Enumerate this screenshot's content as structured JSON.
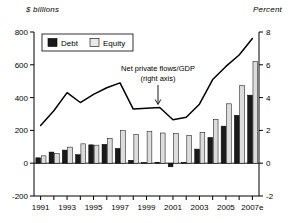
{
  "chart_data": {
    "type": "bar",
    "title": "",
    "subtitle": "",
    "left_axis_label": "$ billions",
    "right_axis_label": "Percent",
    "xlabel": "",
    "ylabel": "$ billions",
    "ylim": [
      -200,
      800
    ],
    "y2lim": [
      -2,
      8
    ],
    "left_ticks": [
      "800",
      "600",
      "400",
      "200",
      "0",
      "-200"
    ],
    "left_tick_values": [
      800,
      600,
      400,
      200,
      0,
      -200
    ],
    "right_ticks": [
      "8",
      "6",
      "4",
      "2",
      "0",
      "-2"
    ],
    "right_tick_values": [
      8,
      6,
      4,
      2,
      0,
      -2
    ],
    "grid": false,
    "legend_position": "top-left",
    "categories": [
      "1991",
      "1992",
      "1993",
      "1994",
      "1995",
      "1996",
      "1997",
      "1998",
      "1999",
      "2000",
      "2001",
      "2002",
      "2003",
      "2004",
      "2005",
      "2006",
      "2007e"
    ],
    "xtick_labels": [
      "1991",
      "",
      "1993",
      "",
      "1995",
      "",
      "1997",
      "",
      "1999",
      "",
      "2001",
      "",
      "2003",
      "",
      "2005",
      "",
      "2007e"
    ],
    "series": [
      {
        "name": "Debt",
        "color": "#1a1a1a",
        "values": [
          33,
          68,
          80,
          52,
          112,
          115,
          90,
          18,
          4,
          6,
          -22,
          5,
          86,
          157,
          226,
          292,
          415
        ]
      },
      {
        "name": "Equity",
        "color": "#dcdcdc",
        "values": [
          45,
          60,
          98,
          118,
          110,
          152,
          198,
          176,
          192,
          184,
          181,
          170,
          188,
          268,
          362,
          474,
          620
        ]
      },
      {
        "name": "Net private flows/GDP (right axis)",
        "type": "line",
        "axis": "right",
        "color": "#000000",
        "values": [
          2.3,
          3.2,
          4.3,
          3.7,
          4.2,
          4.6,
          4.9,
          3.3,
          3.35,
          3.4,
          2.65,
          2.8,
          3.6,
          5.1,
          5.9,
          6.6,
          7.6
        ]
      }
    ],
    "legend_entries": [
      {
        "label": "Debt",
        "color": "#1a1a1a"
      },
      {
        "label": "Equity",
        "color": "#e8e8e8"
      }
    ],
    "annotations": [
      {
        "name": "net-private-flows-annotation",
        "line1": "Net private flows/GDP",
        "line2": "(right axis)",
        "points_to_category": "2000",
        "arrow": "down"
      }
    ]
  }
}
